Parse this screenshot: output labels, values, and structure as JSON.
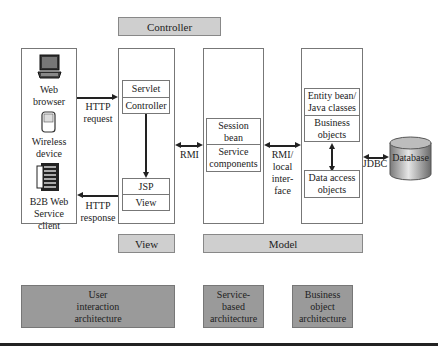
{
  "bands": {
    "controller": "Controller",
    "view": "View",
    "model": "Model"
  },
  "clients": {
    "web_browser": "Web browser",
    "web_browser_l1": "Web",
    "web_browser_l2": "browser",
    "wireless_l1": "Wireless",
    "wireless_l2": "device",
    "b2b_l1": "B2B Web",
    "b2b_l2": "Service",
    "b2b_l3": "client"
  },
  "web_tier": {
    "servlet": "Servlet",
    "controller": "Controller",
    "jsp": "JSP",
    "view": "View"
  },
  "service_tier": {
    "session_l1": "Session",
    "session_l2": "bean",
    "service_l1": "Service",
    "service_l2": "components"
  },
  "business_tier": {
    "entity_l1": "Entity bean/",
    "entity_l2": "Java classes",
    "business_l1": "Business",
    "business_l2": "objects",
    "dao_l1": "Data access",
    "dao_l2": "objects"
  },
  "connectors": {
    "http_request_l1": "HTTP",
    "http_request_l2": "request",
    "http_response_l1": "HTTP",
    "http_response_l2": "response",
    "rmi": "RMI",
    "rmi_local_l1": "RMI/",
    "rmi_local_l2": "local",
    "rmi_local_l3": "inter-",
    "rmi_local_l4": "face",
    "jdbc": "JDBC"
  },
  "database": "Database",
  "architectures": {
    "user_l1": "User",
    "user_l2": "interaction",
    "user_l3": "architecture",
    "service_l1": "Service-",
    "service_l2": "based",
    "service_l3": "architecture",
    "business_l1": "Business",
    "business_l2": "object",
    "business_l3": "architecture"
  }
}
